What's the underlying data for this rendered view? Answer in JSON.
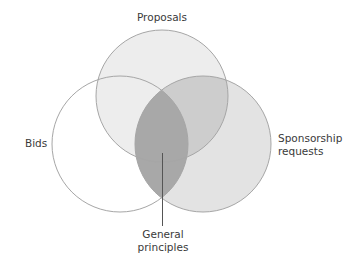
{
  "diagram": {
    "type": "venn",
    "sets": [
      {
        "id": "proposals",
        "label": "Proposals",
        "fill": "#ededed"
      },
      {
        "id": "bids",
        "label": "Bids",
        "fill": "#ffffff"
      },
      {
        "id": "sponsorship",
        "label_line1": "Sponsorship",
        "label_line2": "requests",
        "fill": "#e3e3e3"
      }
    ],
    "overlaps": {
      "proposals_sponsorship_fill": "#cdcdcd",
      "highlight_fill": "#a8a8a8"
    },
    "callout": {
      "line1": "General",
      "line2": "principles"
    },
    "stroke": "#a0a0a0"
  }
}
